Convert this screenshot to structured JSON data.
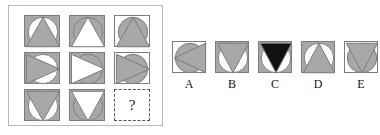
{
  "puzzle": {
    "type": "matrix-reasoning",
    "question_mark": "?",
    "colors": {
      "gray_fill": "#a8a8a8",
      "white_fill": "#ffffff",
      "black_fill": "#111111",
      "stroke": "#7d7d7d",
      "panel_border": "#b8b8b8",
      "dashed_border": "#555555",
      "label_color": "#141414"
    }
  },
  "matrix": {
    "rows": [
      {
        "cells": [
          {
            "square": "gray",
            "circle": "white",
            "triangle": "gray",
            "direction": "up",
            "name": "matrix-cell-r1c1"
          },
          {
            "square": "gray",
            "circle": "gray",
            "triangle": "white",
            "direction": "up",
            "name": "matrix-cell-r1c2"
          },
          {
            "square": "white",
            "circle": "gray",
            "triangle": "gray",
            "direction": "up",
            "name": "matrix-cell-r1c3"
          }
        ]
      },
      {
        "cells": [
          {
            "square": "gray",
            "circle": "white",
            "triangle": "gray",
            "direction": "right",
            "name": "matrix-cell-r2c1"
          },
          {
            "square": "gray",
            "circle": "gray",
            "triangle": "white",
            "direction": "right",
            "name": "matrix-cell-r2c2"
          },
          {
            "square": "white",
            "circle": "gray",
            "triangle": "gray",
            "direction": "right",
            "name": "matrix-cell-r2c3"
          }
        ]
      },
      {
        "cells": [
          {
            "square": "gray",
            "circle": "white",
            "triangle": "gray",
            "direction": "down",
            "name": "matrix-cell-r3c1"
          },
          {
            "square": "gray",
            "circle": "gray",
            "triangle": "white",
            "direction": "down",
            "name": "matrix-cell-r3c2"
          },
          {
            "square": "missing",
            "circle": "none",
            "triangle": "none",
            "direction": "none",
            "name": "matrix-cell-r3c3-missing"
          }
        ]
      }
    ]
  },
  "options": [
    {
      "label": "A",
      "square": "white",
      "circle": "gray",
      "triangle": "gray",
      "direction": "left"
    },
    {
      "label": "B",
      "square": "gray",
      "circle": "white",
      "triangle": "gray",
      "direction": "down"
    },
    {
      "label": "C",
      "square": "gray",
      "circle": "white",
      "triangle": "black",
      "direction": "down"
    },
    {
      "label": "D",
      "square": "gray",
      "circle": "white",
      "triangle": "gray",
      "direction": "up"
    },
    {
      "label": "E",
      "square": "white",
      "circle": "gray",
      "triangle": "gray",
      "direction": "down"
    }
  ]
}
